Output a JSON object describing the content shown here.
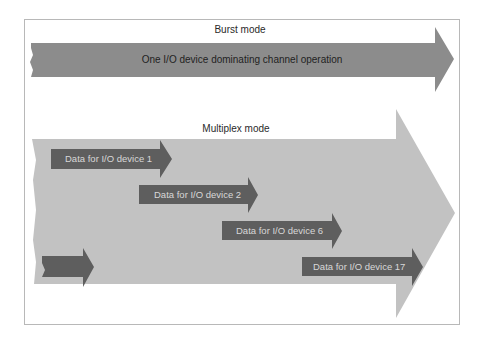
{
  "burst": {
    "title": "Burst mode",
    "arrow_label": "One I/O device dominating channel operation"
  },
  "multiplex": {
    "title": "Multiplex mode",
    "devices": [
      {
        "label": "Data for I/O device 1"
      },
      {
        "label": "Data for I/O device 2"
      },
      {
        "label": "Data for I/O device 6"
      },
      {
        "label": "Data for I/O device 17"
      }
    ]
  },
  "colors": {
    "burst_arrow": "#8c8c8c",
    "multiplex_arrow": "#c2c2c2",
    "device_arrow": "#5e5e5e",
    "frame": "#b8b8b8"
  }
}
